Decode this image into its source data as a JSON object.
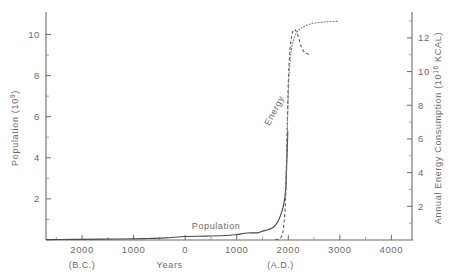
{
  "chart_data": {
    "type": "line",
    "title": "",
    "subtitle": "",
    "xlabel": "Years",
    "xlabel_left_era": "(B.C.)",
    "xlabel_right_era": "(A.D.)",
    "ylabel_left": "Population (10",
    "ylabel_left_exp": "9",
    "ylabel_left_close": ")",
    "ylabel_right": "Annual Energy Consumption (10",
    "ylabel_right_exp": "16",
    "ylabel_right_close": " KCAL)",
    "xlim": [
      -2700,
      4400
    ],
    "xticks": [
      -2000,
      -1000,
      0,
      1000,
      2000,
      3000,
      4000
    ],
    "xticklabels": [
      "2000",
      "1000",
      "0",
      "1000",
      "2000",
      "3000",
      "4000"
    ],
    "ylim_left": [
      0,
      10.9
    ],
    "yticks_left": [
      2,
      4,
      6,
      8,
      10
    ],
    "yticklabels_left": [
      "2",
      "4",
      "6",
      "8",
      "10"
    ],
    "ylim_right": [
      0,
      13.3
    ],
    "yticks_right": [
      2,
      4,
      6,
      8,
      10,
      12
    ],
    "yticklabels_right": [
      "2",
      "4",
      "6",
      "8",
      "10",
      "12"
    ],
    "grid": false,
    "legend_position": "inline-annotations",
    "annotations": [
      {
        "text": "Population",
        "x": 600,
        "y": 0.55,
        "rotation": 0
      },
      {
        "text": "Energy",
        "x": 1780,
        "y": 7.6,
        "rotation": -62
      }
    ],
    "series": [
      {
        "name": "Population",
        "style": "solid",
        "axis": "left",
        "x": [
          -2700,
          -2400,
          -2000,
          -1600,
          -1200,
          -800,
          -400,
          0,
          400,
          800,
          1000,
          1200,
          1400,
          1500,
          1600,
          1700,
          1750,
          1800,
          1850,
          1900,
          1930,
          1950,
          1960,
          1970,
          1975,
          1980,
          1985,
          1990
        ],
        "y": [
          0.02,
          0.025,
          0.03,
          0.04,
          0.05,
          0.07,
          0.1,
          0.17,
          0.19,
          0.22,
          0.27,
          0.34,
          0.35,
          0.43,
          0.5,
          0.6,
          0.72,
          0.9,
          1.2,
          1.6,
          2.0,
          2.5,
          3.0,
          3.7,
          4.1,
          4.4,
          4.8,
          5.3
        ]
      },
      {
        "name": "Energy (projection, declining)",
        "style": "dashed",
        "axis": "right",
        "x": [
          1750,
          1800,
          1850,
          1880,
          1900,
          1920,
          1940,
          1950,
          1960,
          1970,
          1980,
          1990,
          2000,
          2020,
          2050,
          2080,
          2110,
          2140,
          2170,
          2200,
          2230,
          2260,
          2300,
          2340,
          2380,
          2400
        ],
        "y": [
          0.02,
          0.05,
          0.12,
          0.3,
          0.55,
          1.1,
          1.9,
          2.8,
          4.0,
          5.4,
          6.8,
          8.1,
          9.3,
          10.7,
          11.8,
          12.3,
          12.5,
          12.45,
          12.3,
          12.0,
          11.7,
          11.4,
          11.2,
          11.1,
          11.05,
          11.0
        ]
      },
      {
        "name": "Energy (projection, sustained)",
        "style": "dotted",
        "axis": "right",
        "x": [
          1950,
          1980,
          2000,
          2020,
          2060,
          2100,
          2150,
          2200,
          2260,
          2320,
          2400,
          2500,
          2600,
          2700,
          2800,
          2900,
          2960
        ],
        "y": [
          2.6,
          6.2,
          8.6,
          10.0,
          11.3,
          11.9,
          12.25,
          12.45,
          12.6,
          12.7,
          12.8,
          12.88,
          12.92,
          12.95,
          12.97,
          12.98,
          12.98
        ]
      }
    ]
  }
}
